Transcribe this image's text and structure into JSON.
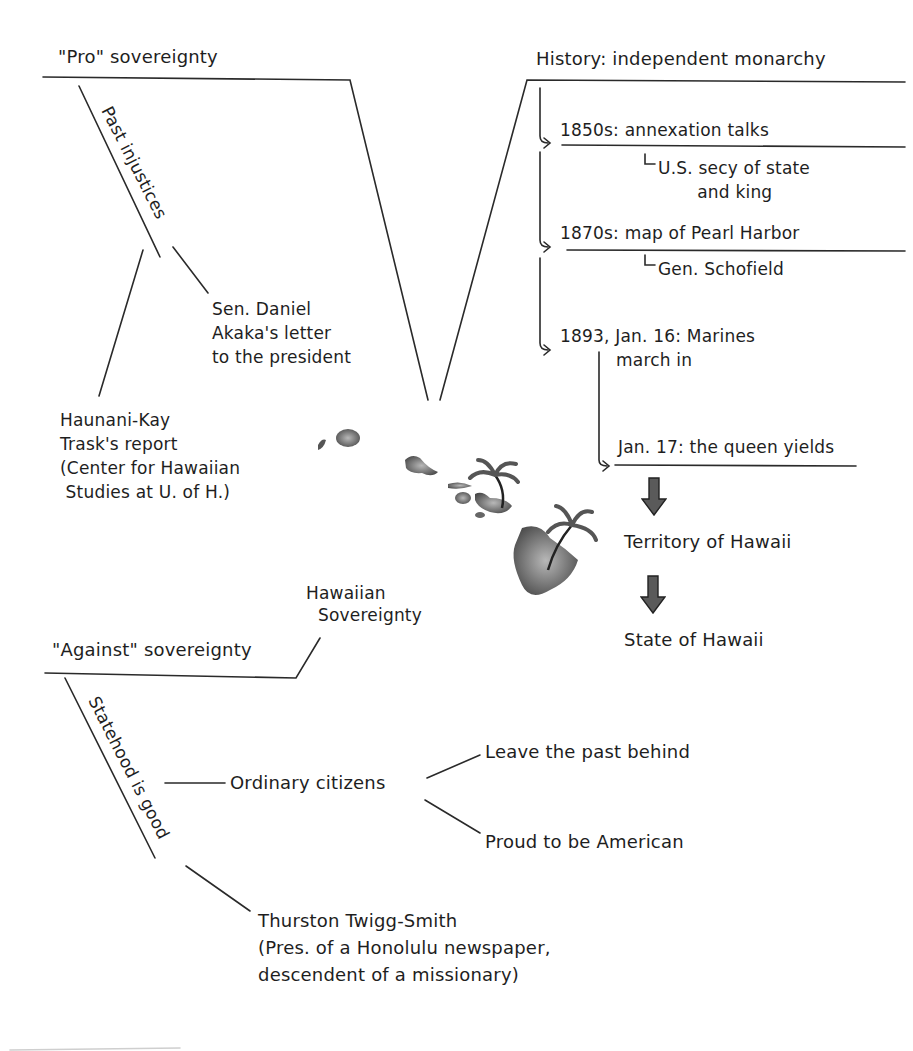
{
  "center": {
    "title_line1": "Hawaiian",
    "title_line2": "Sovereignty",
    "image": "hawaiian-islands-with-palm-trees"
  },
  "pro": {
    "heading": "\"Pro\" sovereignty",
    "branch": "Past injustices",
    "items": [
      "Sen. Daniel\nAkaka's letter\nto the president",
      "Haunani-Kay\nTrask's report\n(Center for Hawaiian\n Studies at U. of H.)"
    ]
  },
  "history": {
    "heading": "History: independent monarchy",
    "events": [
      {
        "label": "1850s:  annexation talks",
        "detail": "U.S. secy of state\n       and king"
      },
      {
        "label": "1870s:  map of Pearl Harbor",
        "detail": "Gen. Schofield"
      },
      {
        "label": "1893, Jan. 16: Marines\n          march in"
      },
      {
        "label": "Jan. 17: the queen yields"
      }
    ],
    "outcomes": [
      "Territory of Hawaii",
      "State of Hawaii"
    ],
    "arrow_color": "#5a5a5a"
  },
  "against": {
    "heading": "\"Against\" sovereignty",
    "branch": "Statehood is good",
    "group": "Ordinary citizens",
    "group_items": [
      "Leave the past behind",
      "Proud to be American"
    ],
    "person": "Thurston Twigg-Smith\n(Pres. of a Honolulu newspaper,\ndescendent of a missionary)"
  }
}
